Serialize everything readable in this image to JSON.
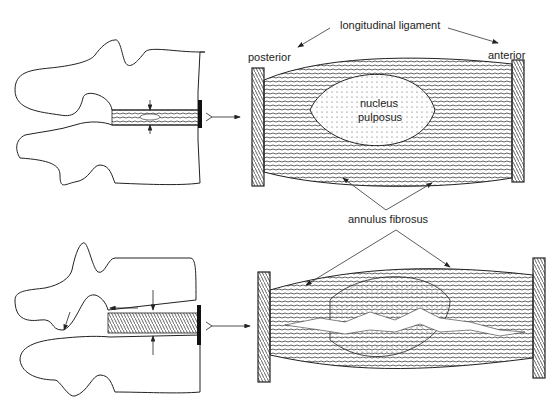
{
  "labels": {
    "longitudinal_ligament": "longitudinal ligament",
    "posterior": "posterior",
    "anterior": "anterior",
    "nucleus_line1": "nucleus",
    "nucleus_line2": "pulposus",
    "annulus_fibrosus": "annulus fibrosus"
  },
  "panels": [
    {
      "id": "healthy",
      "description": "Side view of two vertebrae with intact intervertebral disc; enlarged cross-section shows nucleus pulposus surrounded by annulus fibrosus"
    },
    {
      "id": "degenerated",
      "description": "Side view of two vertebrae with compressed disc; enlarged cross-section shows fissured disc with torn annulus"
    }
  ],
  "colors": {
    "ink": "#1a1a1a",
    "background": "#ffffff"
  }
}
